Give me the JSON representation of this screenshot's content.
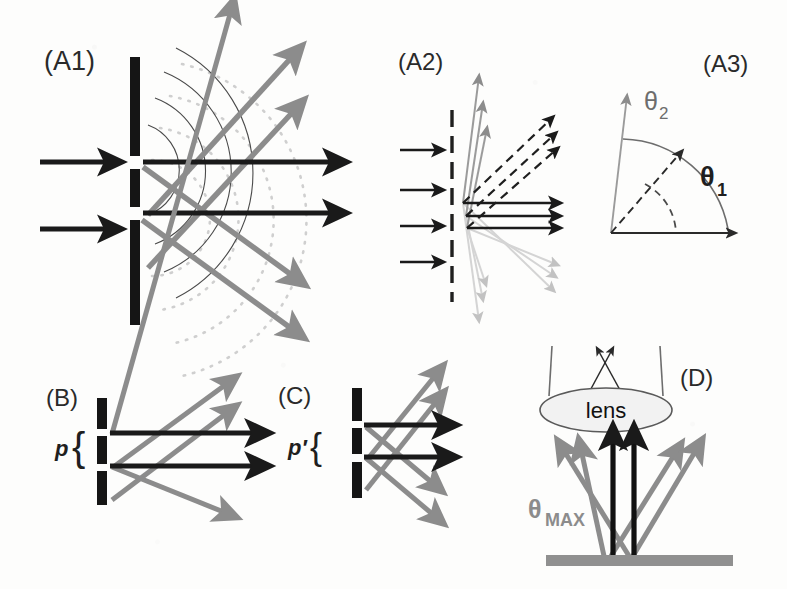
{
  "figure": {
    "background_color": "#fdfdfc",
    "ink_black": "#1a1a1a",
    "ink_gray": "#8c8c8c",
    "ink_light_gray": "#c0c0c0",
    "ink_thin": "#555555"
  },
  "panels": {
    "a1": {
      "label": "(A1)",
      "description": "Two-slit aperture with spherical wavefronts and diffracted orders",
      "incoming_rays": 2,
      "zero_order_rays": 2,
      "diffracted_gray_rays": 4,
      "solid_wavefronts": 4,
      "dotted_wavefronts": 4,
      "slit_bars": 3
    },
    "a2": {
      "label": "(A2)",
      "description": "Grating with multiple diffraction orders",
      "incoming_rays": 4,
      "zero_order_solid_rays": 3,
      "dashed_order_rays": 3,
      "steep_gray_rays": 3,
      "faint_down_rays": 6
    },
    "a3": {
      "label": "(A3)",
      "description": "Diffraction angles theta1 and theta2 with arcs",
      "theta1": "θ",
      "theta1_sub": "1",
      "theta2": "θ",
      "theta2_sub": "2"
    },
    "b": {
      "label": "(B)",
      "pitch_symbol": "p",
      "brace": "{",
      "description": "Large grating pitch p gives small diffraction angle",
      "slit_bars": 3,
      "zero_order_rays": 2,
      "gray_rays": 4
    },
    "c": {
      "label": "(C)",
      "pitch_symbol": "p′",
      "brace": "{",
      "description": "Small grating pitch p-prime gives large diffraction angle",
      "slit_bars": 3,
      "zero_order_rays": 2,
      "gray_rays": 4
    },
    "d": {
      "label": "(D)",
      "lens_label": "lens",
      "theta_max": "θ",
      "theta_max_sub": "MAX",
      "description": "Collection of diffracted orders by an objective lens with maximum acceptance angle",
      "zero_order_rays": 2,
      "gray_rays": 4,
      "substrate": true
    }
  }
}
